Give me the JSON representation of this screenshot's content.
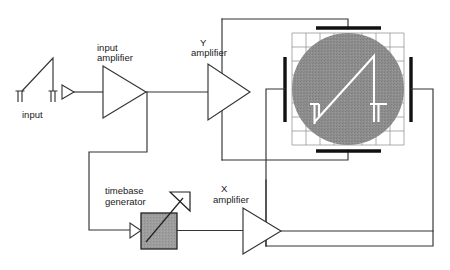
{
  "diagram": {
    "type": "block-diagram",
    "canvas": {
      "width": 450,
      "height": 270
    },
    "background_color": "#ffffff",
    "line_color": "#333333",
    "plate_color": "#111111",
    "screen_fill": "#8c8c8c",
    "trace_color": "#ffffff",
    "timebase_fill": "#9a9a9a"
  },
  "labels": {
    "input": "input",
    "input_amplifier": "input\namplifier",
    "input_amplifier_line1": "input",
    "input_amplifier_line2": "amplifier",
    "y_amplifier_line1": "Y",
    "y_amplifier_line2": "amplifier",
    "x_amplifier_line1": "X",
    "x_amplifier_line2": "amplifier",
    "timebase_line1": "timebase",
    "timebase_line2": "generator"
  },
  "blocks": [
    {
      "id": "input-source",
      "name": "input-waveform-source",
      "label": "input",
      "shape": "sawtooth-terminals"
    },
    {
      "id": "input-buffer",
      "name": "input-buffer-triangle",
      "label": "",
      "shape": "small-triangle"
    },
    {
      "id": "input-amplifier",
      "name": "input-amplifier",
      "label": "input amplifier",
      "shape": "triangle-right"
    },
    {
      "id": "y-amplifier",
      "name": "y-amplifier",
      "label": "Y amplifier",
      "shape": "triangle-right"
    },
    {
      "id": "x-amplifier",
      "name": "x-amplifier",
      "label": "X amplifier",
      "shape": "triangle-right"
    },
    {
      "id": "timebase-generator",
      "name": "timebase-generator",
      "label": "timebase generator",
      "shape": "square-variable"
    },
    {
      "id": "crt-screen",
      "name": "crt-screen",
      "label": "",
      "shape": "circle-grid"
    }
  ],
  "deflection_plates": [
    {
      "name": "top-plate",
      "orientation": "horizontal",
      "position": "top"
    },
    {
      "name": "bottom-plate",
      "orientation": "horizontal",
      "position": "bottom"
    },
    {
      "name": "left-plate",
      "orientation": "vertical",
      "position": "left"
    },
    {
      "name": "right-plate",
      "orientation": "vertical",
      "position": "right"
    }
  ],
  "screen": {
    "grid_columns": 8,
    "grid_rows": 8,
    "trace_type": "sawtooth",
    "trace_description": "rising ramp with vertical flyback and terminal posts"
  }
}
